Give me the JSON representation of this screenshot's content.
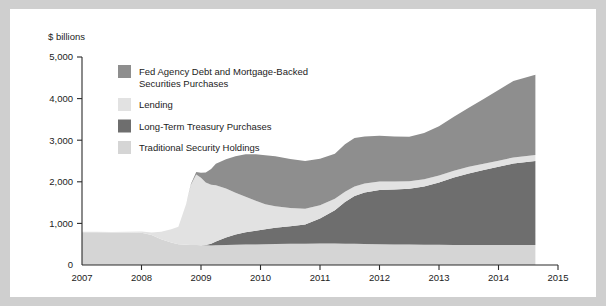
{
  "chart_data": {
    "type": "area",
    "stacked": true,
    "title": "",
    "subtitle": "",
    "ylabel": "$ billions",
    "xlabel": "",
    "ylim": [
      0,
      5000
    ],
    "xlim": [
      2007,
      2015
    ],
    "yticks": [
      0,
      1000,
      2000,
      3000,
      4000,
      5000
    ],
    "ytick_labels": [
      "0",
      "1,000",
      "2,000",
      "3,000",
      "4,000",
      "5,000"
    ],
    "xticks": [
      2007,
      2008,
      2009,
      2010,
      2011,
      2012,
      2013,
      2014,
      2015
    ],
    "xtick_labels": [
      "2007",
      "2008",
      "2009",
      "2010",
      "2011",
      "2012",
      "2013",
      "2014",
      "2015"
    ],
    "grid": false,
    "legend_position": "upper-left-inside",
    "data_end_x": 2014.62,
    "stack_order_bottom_to_top": [
      "Traditional Security Holdings",
      "Long-Term Treasury Purchases",
      "Lending",
      "Fed Agency Debt and Mortgage-Backed Securities Purchases"
    ],
    "x": [
      2007.0,
      2007.25,
      2007.5,
      2007.75,
      2008.0,
      2008.17,
      2008.33,
      2008.5,
      2008.62,
      2008.75,
      2008.83,
      2008.92,
      2009.0,
      2009.08,
      2009.17,
      2009.25,
      2009.42,
      2009.58,
      2009.75,
      2009.92,
      2010.08,
      2010.25,
      2010.5,
      2010.75,
      2011.0,
      2011.25,
      2011.42,
      2011.58,
      2011.75,
      2012.0,
      2012.25,
      2012.5,
      2012.75,
      2013.0,
      2013.25,
      2013.5,
      2013.75,
      2014.0,
      2014.25,
      2014.62
    ],
    "series": [
      {
        "name": "Traditional Security Holdings",
        "color": "#d5d5d5",
        "values": [
          790,
          785,
          782,
          780,
          778,
          720,
          620,
          540,
          500,
          485,
          480,
          478,
          475,
          472,
          470,
          475,
          480,
          485,
          490,
          495,
          500,
          505,
          510,
          512,
          515,
          515,
          512,
          510,
          505,
          500,
          495,
          490,
          488,
          485,
          483,
          482,
          481,
          480,
          480,
          480
        ]
      },
      {
        "name": "Long-Term Treasury Purchases",
        "color": "#6e6e6e",
        "values": [
          0,
          0,
          0,
          0,
          0,
          0,
          0,
          0,
          0,
          0,
          0,
          0,
          0,
          10,
          40,
          90,
          180,
          250,
          300,
          330,
          360,
          390,
          420,
          460,
          600,
          800,
          1000,
          1150,
          1240,
          1300,
          1320,
          1340,
          1400,
          1500,
          1620,
          1720,
          1800,
          1880,
          1960,
          2020
        ]
      },
      {
        "name": "Lending",
        "color": "#e2e2e2",
        "values": [
          10,
          12,
          14,
          18,
          25,
          60,
          180,
          320,
          420,
          980,
          1450,
          1700,
          1620,
          1500,
          1420,
          1350,
          1180,
          1000,
          850,
          720,
          600,
          520,
          440,
          380,
          320,
          280,
          250,
          230,
          215,
          205,
          195,
          185,
          175,
          168,
          162,
          158,
          152,
          148,
          145,
          142
        ]
      },
      {
        "name": "Fed Agency Debt and Mortgage-Backed Securities Purchases",
        "color": "#8e8e8e",
        "values": [
          0,
          0,
          0,
          0,
          0,
          0,
          0,
          0,
          0,
          0,
          20,
          60,
          120,
          240,
          380,
          520,
          700,
          880,
          1020,
          1120,
          1180,
          1200,
          1180,
          1150,
          1120,
          1080,
          1140,
          1160,
          1130,
          1100,
          1080,
          1070,
          1110,
          1180,
          1300,
          1420,
          1560,
          1700,
          1840,
          1930
        ]
      }
    ]
  },
  "legend": {
    "items": [
      {
        "label": "Fed Agency Debt and Mortgage-Backed Securities Purchases",
        "color": "#8e8e8e"
      },
      {
        "label": "Lending",
        "color": "#e2e2e2"
      },
      {
        "label": "Long-Term Treasury Purchases",
        "color": "#6e6e6e"
      },
      {
        "label": "Traditional Security Holdings",
        "color": "#d5d5d5"
      }
    ]
  }
}
